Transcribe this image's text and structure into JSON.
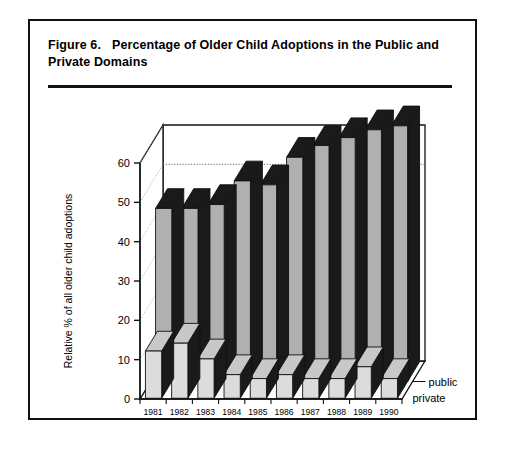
{
  "figure": {
    "number_label": "Figure 6.",
    "title": "Percentage of Older Child Adoptions in the Public and Private Domains"
  },
  "chart_data": {
    "type": "bar",
    "style": "3d-grouped-bar",
    "title": "Percentage of Older Child Adoptions in the Public and Private Domains",
    "xlabel": "",
    "ylabel": "Relative % of all older child adoptions",
    "ylim": [
      0,
      60
    ],
    "yticks": [
      0,
      10,
      20,
      30,
      40,
      50,
      60
    ],
    "ytick_labels": [
      "0",
      "10",
      "20",
      "30",
      "40",
      "50",
      "60"
    ],
    "grid": true,
    "gridlines_shown": [
      50,
      60
    ],
    "legend_position": "right-of-axes",
    "categories": [
      "1981",
      "1982",
      "1983",
      "1984",
      "1985",
      "1986",
      "1987",
      "1988",
      "1989",
      "1990"
    ],
    "series": [
      {
        "name": "public",
        "color": "#b0b0b0",
        "side_color": "#1a1a1a",
        "top_color": "#1a1a1a",
        "values": [
          44,
          44,
          45,
          51,
          50,
          57,
          60,
          62,
          64,
          65
        ]
      },
      {
        "name": "private",
        "color": "#dcdcdc",
        "side_color": "#1a1a1a",
        "top_color": "#c8c8c8",
        "values": [
          12,
          14,
          10,
          6,
          5,
          6,
          5,
          5,
          8,
          5
        ]
      }
    ]
  },
  "colors": {
    "frame": "#111111",
    "rule": "#111111",
    "background": "#ffffff",
    "public_fill": "#b0b0b0",
    "private_fill": "#dcdcdc",
    "bar_edge": "#1a1a1a"
  }
}
